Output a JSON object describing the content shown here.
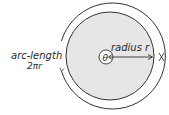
{
  "diagram": {
    "type": "circle-arc-length",
    "labels": {
      "arc_length": "arc-length",
      "arc_formula": "2πr",
      "radius": "radius r",
      "angle": "θ"
    },
    "colors": {
      "disc_fill": "#e6e6e6",
      "stroke": "#333333",
      "background": "#ffffff"
    }
  }
}
